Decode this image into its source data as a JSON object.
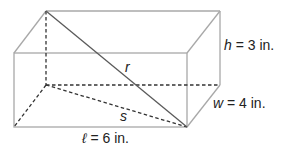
{
  "figure": {
    "labels": {
      "height": {
        "var": "h",
        "rest": " = 3 in."
      },
      "width": {
        "var": "w",
        "rest": " = 4 in."
      },
      "length": {
        "var": "ℓ",
        "rest": " = 6 in."
      },
      "space_diagonal": "r",
      "base_diagonal": "s"
    },
    "colors": {
      "visible_edge": "#a8a8a8",
      "hidden_edge": "#333333",
      "diagonal": "#5a5a5a",
      "text": "#222222"
    }
  }
}
